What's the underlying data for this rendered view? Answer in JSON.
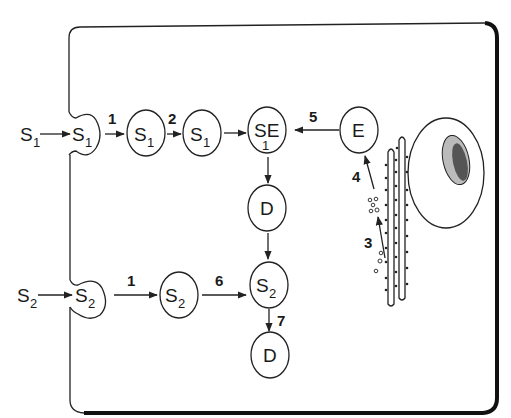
{
  "diagram": {
    "type": "cell-transport-pathway",
    "nodes": {
      "s1_outside": {
        "main": "S",
        "sub": "1"
      },
      "s1_receptor": {
        "main": "S",
        "sub": "1"
      },
      "s1_a": {
        "main": "S",
        "sub": "1"
      },
      "s1_b": {
        "main": "S",
        "sub": "1"
      },
      "s1e": {
        "main": "SE",
        "sub": "1"
      },
      "e": {
        "main": "E"
      },
      "d_top": {
        "main": "D"
      },
      "s2_outside": {
        "main": "S",
        "sub": "2"
      },
      "s2_receptor": {
        "main": "S",
        "sub": "2"
      },
      "s2_a": {
        "main": "S",
        "sub": "2"
      },
      "s2_b": {
        "main": "S",
        "sub": "2"
      },
      "d_bottom": {
        "main": "D"
      }
    },
    "step_labels": {
      "s1_uptake": "1",
      "s1_step2": "2",
      "e_to_s1e": "5",
      "vesicle_to_e": "4",
      "er_to_vesicle": "3",
      "s2_uptake": "1",
      "s2_step6": "6",
      "s2_to_d": "7"
    },
    "structures": [
      "cell-membrane",
      "nucleus",
      "endoplasmic-reticulum",
      "vesicles"
    ],
    "colors": {
      "line": "#222222",
      "background": "#ffffff"
    }
  }
}
